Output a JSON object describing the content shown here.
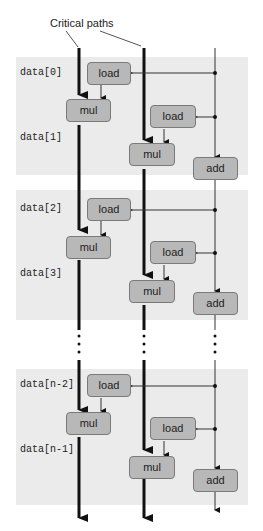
{
  "diagram": {
    "title": "Critical paths",
    "colors": {
      "band": "#ebebeb",
      "box_fill": "#b8b8b8",
      "box_border": "#7a7a7a",
      "line": "#111111"
    },
    "iterations": [
      {
        "labels": [
          "data[0]",
          "data[1]"
        ],
        "ops": {
          "load_a": "load",
          "mul_a": "mul",
          "load_b": "load",
          "mul_b": "mul",
          "add": "add"
        }
      },
      {
        "labels": [
          "data[2]",
          "data[3]"
        ],
        "ops": {
          "load_a": "load",
          "mul_a": "mul",
          "load_b": "load",
          "mul_b": "mul",
          "add": "add"
        }
      },
      {
        "labels": [
          "data[n-2]",
          "data[n-1]"
        ],
        "ops": {
          "load_a": "load",
          "mul_a": "mul",
          "load_b": "load",
          "mul_b": "mul",
          "add": "add"
        }
      }
    ],
    "ellipsis": "⋮"
  }
}
